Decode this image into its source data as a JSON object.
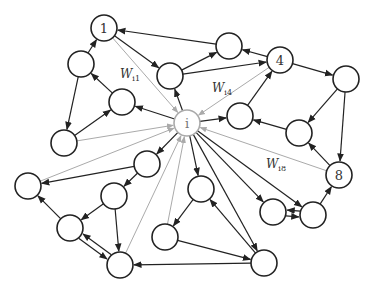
{
  "diagram": {
    "type": "directed-network",
    "central_node": "i",
    "colors": {
      "edge": "#222222",
      "weight_edge": "#aaaaaa",
      "node_stroke": "#222222",
      "central_stroke": "#aaaaaa"
    },
    "node_radius": 13,
    "nodes": [
      {
        "id": "i",
        "label": "i",
        "x": 187,
        "y": 123,
        "style": "gray"
      },
      {
        "id": "1",
        "label": "1",
        "x": 104,
        "y": 28
      },
      {
        "id": "4",
        "label": "4",
        "x": 280,
        "y": 60
      },
      {
        "id": "8",
        "label": "8",
        "x": 339,
        "y": 175
      },
      {
        "id": "a",
        "label": "",
        "x": 81,
        "y": 64
      },
      {
        "id": "b",
        "label": "",
        "x": 122,
        "y": 102
      },
      {
        "id": "c",
        "label": "",
        "x": 64,
        "y": 143
      },
      {
        "id": "d",
        "label": "",
        "x": 28,
        "y": 186
      },
      {
        "id": "e",
        "label": "",
        "x": 147,
        "y": 164
      },
      {
        "id": "f",
        "label": "",
        "x": 114,
        "y": 196
      },
      {
        "id": "g",
        "label": "",
        "x": 70,
        "y": 228
      },
      {
        "id": "h",
        "label": "",
        "x": 120,
        "y": 265
      },
      {
        "id": "j",
        "label": "",
        "x": 165,
        "y": 237
      },
      {
        "id": "k",
        "label": "",
        "x": 201,
        "y": 189
      },
      {
        "id": "l",
        "label": "",
        "x": 273,
        "y": 212
      },
      {
        "id": "m",
        "label": "",
        "x": 264,
        "y": 263
      },
      {
        "id": "n",
        "label": "",
        "x": 313,
        "y": 215
      },
      {
        "id": "p",
        "label": "",
        "x": 170,
        "y": 76
      },
      {
        "id": "q",
        "label": "",
        "x": 229,
        "y": 46
      },
      {
        "id": "r",
        "label": "",
        "x": 346,
        "y": 79
      },
      {
        "id": "s",
        "label": "",
        "x": 240,
        "y": 116
      },
      {
        "id": "t",
        "label": "",
        "x": 299,
        "y": 133
      }
    ],
    "edges": [
      {
        "from": "1",
        "to": "i",
        "style": "gray"
      },
      {
        "from": "4",
        "to": "i",
        "style": "gray"
      },
      {
        "from": "8",
        "to": "i",
        "style": "gray"
      },
      {
        "from": "c",
        "to": "i",
        "style": "gray"
      },
      {
        "from": "d",
        "to": "i",
        "style": "gray"
      },
      {
        "from": "h",
        "to": "i",
        "style": "gray"
      },
      {
        "from": "j",
        "to": "i",
        "style": "gray"
      },
      {
        "from": "i",
        "to": "p"
      },
      {
        "from": "i",
        "to": "b"
      },
      {
        "from": "i",
        "to": "s"
      },
      {
        "from": "i",
        "to": "e"
      },
      {
        "from": "i",
        "to": "k"
      },
      {
        "from": "i",
        "to": "m"
      },
      {
        "from": "i",
        "to": "l"
      },
      {
        "from": "i",
        "to": "n"
      },
      {
        "from": "q",
        "to": "1"
      },
      {
        "from": "1",
        "to": "p"
      },
      {
        "from": "p",
        "to": "q"
      },
      {
        "from": "p",
        "to": "4"
      },
      {
        "from": "4",
        "to": "q"
      },
      {
        "from": "4",
        "to": "r"
      },
      {
        "from": "r",
        "to": "t"
      },
      {
        "from": "r",
        "to": "8"
      },
      {
        "from": "t",
        "to": "s"
      },
      {
        "from": "s",
        "to": "4"
      },
      {
        "from": "8",
        "to": "t"
      },
      {
        "from": "n",
        "to": "8"
      },
      {
        "from": "l",
        "to": "n"
      },
      {
        "from": "n",
        "to": "l"
      },
      {
        "from": "a",
        "to": "1"
      },
      {
        "from": "a",
        "to": "c"
      },
      {
        "from": "b",
        "to": "a"
      },
      {
        "from": "c",
        "to": "b"
      },
      {
        "from": "e",
        "to": "d"
      },
      {
        "from": "e",
        "to": "f"
      },
      {
        "from": "f",
        "to": "g"
      },
      {
        "from": "f",
        "to": "h"
      },
      {
        "from": "g",
        "to": "d"
      },
      {
        "from": "g",
        "to": "h"
      },
      {
        "from": "h",
        "to": "g"
      },
      {
        "from": "k",
        "to": "j"
      },
      {
        "from": "m",
        "to": "k"
      },
      {
        "from": "m",
        "to": "h"
      },
      {
        "from": "j",
        "to": "m"
      }
    ],
    "weight_labels": [
      {
        "base": "W",
        "sub": "i1",
        "x": 120,
        "y": 78
      },
      {
        "base": "W",
        "sub": "i4",
        "x": 212,
        "y": 92
      },
      {
        "base": "W",
        "sub": "i8",
        "x": 266,
        "y": 168
      }
    ]
  }
}
